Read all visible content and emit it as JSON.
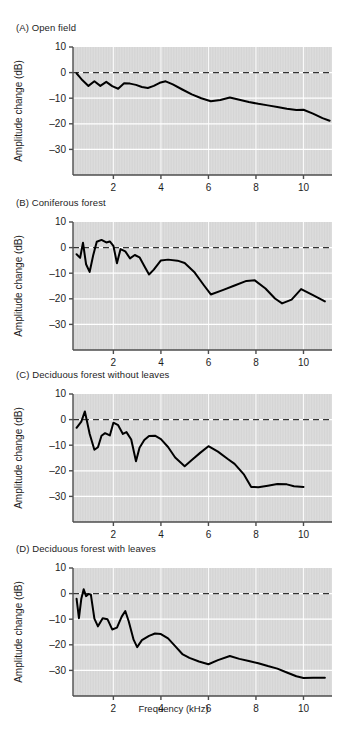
{
  "figure": {
    "background": "#ffffff",
    "plot_background": "#dcdcdc",
    "grid_color": "#ffffff",
    "axis_color": "#4d4d4d",
    "curve_color": "#000000",
    "reference_line_color": "#333333",
    "xlabel": "Frequency (kHz)"
  },
  "panels": [
    {
      "id": "A",
      "title": "(A)  Open field",
      "label_letter": "(A)",
      "label_text": "Open field"
    },
    {
      "id": "B",
      "title": "(B)  Coniferous forest",
      "label_letter": "(B)",
      "label_text": "Coniferous forest"
    },
    {
      "id": "C",
      "title": "(C)  Deciduous forest without leaves",
      "label_letter": "(C)",
      "label_text": "Deciduous forest without leaves"
    },
    {
      "id": "D",
      "title": "(D)  Deciduous forest with leaves",
      "label_letter": "(D)",
      "label_text": "Deciduous forest with leaves"
    }
  ],
  "chart_data": [
    {
      "type": "line",
      "panel": "A",
      "title": "(A)  Open field",
      "xlabel": "",
      "ylabel": "Amplitude change (dB)",
      "xlim": [
        0.3,
        11.2
      ],
      "ylim": [
        -40,
        10
      ],
      "xticks": [
        2,
        4,
        6,
        8,
        10
      ],
      "xtick_labels": [
        "2",
        "4",
        "6",
        "8",
        "10"
      ],
      "yticks": [
        10,
        0,
        -10,
        -20,
        -30
      ],
      "ytick_labels": [
        "10",
        "0",
        "-10",
        "-20",
        "-30"
      ],
      "grid": true,
      "legend": null,
      "annotations": [
        {
          "type": "hline",
          "y": 0,
          "style": "dashed",
          "label": "0 dB reference"
        }
      ],
      "series": [
        {
          "name": "Amplitude change",
          "x": [
            0.45,
            0.7,
            0.95,
            1.2,
            1.45,
            1.7,
            1.95,
            2.2,
            2.45,
            2.7,
            2.95,
            3.2,
            3.45,
            3.7,
            3.95,
            4.2,
            4.5,
            4.9,
            5.3,
            5.7,
            6.1,
            6.5,
            6.9,
            7.3,
            7.7,
            8.1,
            8.5,
            8.9,
            9.3,
            9.7,
            10.0,
            10.4,
            10.8,
            11.1
          ],
          "y": [
            -0.3,
            -3.0,
            -5.2,
            -3.4,
            -5.2,
            -3.6,
            -5.3,
            -6.3,
            -4.2,
            -4.3,
            -4.8,
            -5.6,
            -6.0,
            -5.2,
            -4.0,
            -3.4,
            -4.6,
            -6.6,
            -8.5,
            -10.0,
            -11.2,
            -10.7,
            -9.7,
            -10.6,
            -11.5,
            -12.2,
            -12.8,
            -13.4,
            -14.1,
            -14.6,
            -14.5,
            -16.0,
            -17.8,
            -18.8
          ]
        }
      ]
    },
    {
      "type": "line",
      "panel": "B",
      "title": "(B)  Coniferous forest",
      "xlabel": "",
      "ylabel": "Amplitude change (dB)",
      "xlim": [
        0.3,
        11.2
      ],
      "ylim": [
        -40,
        10
      ],
      "xticks": [
        2,
        4,
        6,
        8,
        10
      ],
      "xtick_labels": [
        "2",
        "4",
        "6",
        "8",
        "10"
      ],
      "yticks": [
        10,
        0,
        -10,
        -20,
        -30
      ],
      "ytick_labels": [
        "10",
        "0",
        "-10",
        "-20",
        "-30"
      ],
      "grid": true,
      "legend": null,
      "annotations": [
        {
          "type": "hline",
          "y": 0,
          "style": "dashed",
          "label": "0 dB reference"
        }
      ],
      "series": [
        {
          "name": "Amplitude change",
          "x": [
            0.45,
            0.6,
            0.72,
            0.85,
            1.0,
            1.15,
            1.3,
            1.5,
            1.7,
            1.85,
            2.0,
            2.15,
            2.3,
            2.5,
            2.7,
            2.9,
            3.1,
            3.3,
            3.5,
            3.7,
            4.0,
            4.3,
            4.7,
            5.0,
            5.4,
            5.8,
            6.1,
            6.6,
            7.1,
            7.6,
            7.95,
            8.4,
            8.8,
            9.1,
            9.5,
            9.9,
            10.4,
            10.9
          ],
          "y": [
            -2.6,
            -4.0,
            1.9,
            -6.5,
            -9.5,
            -3.0,
            2.3,
            3.0,
            2.0,
            2.4,
            0.7,
            -6.1,
            -0.6,
            -1.5,
            -4.2,
            -2.9,
            -3.8,
            -7.2,
            -10.5,
            -8.6,
            -5.0,
            -4.7,
            -5.1,
            -6.0,
            -9.5,
            -14.6,
            -18.3,
            -16.6,
            -14.8,
            -13.0,
            -12.8,
            -16.0,
            -19.9,
            -21.8,
            -20.3,
            -16.2,
            -18.6,
            -21.0
          ]
        }
      ]
    },
    {
      "type": "line",
      "panel": "C",
      "title": "(C)  Deciduous forest without leaves",
      "xlabel": "",
      "ylabel": "Amplitude change (dB)",
      "xlim": [
        0.3,
        11.2
      ],
      "ylim": [
        -40,
        10
      ],
      "xticks": [
        2,
        4,
        6,
        8,
        10
      ],
      "xtick_labels": [
        "2",
        "4",
        "6",
        "8",
        "10"
      ],
      "yticks": [
        10,
        0,
        -10,
        -20,
        -30
      ],
      "ytick_labels": [
        "10",
        "0",
        "-10",
        "-20",
        "-30"
      ],
      "grid": true,
      "legend": null,
      "annotations": [
        {
          "type": "hline",
          "y": 0,
          "style": "dashed",
          "label": "0 dB reference"
        }
      ],
      "series": [
        {
          "name": "Amplitude change",
          "x": [
            0.45,
            0.65,
            0.8,
            1.0,
            1.2,
            1.35,
            1.5,
            1.65,
            1.85,
            2.0,
            2.2,
            2.4,
            2.55,
            2.75,
            2.95,
            3.1,
            3.3,
            3.5,
            3.75,
            4.0,
            4.3,
            4.6,
            5.0,
            5.3,
            5.65,
            6.0,
            6.4,
            6.8,
            7.1,
            7.5,
            7.8,
            8.1,
            8.5,
            8.9,
            9.3,
            9.6,
            10.0
          ],
          "y": [
            -3.2,
            -0.8,
            3.2,
            -5.5,
            -11.8,
            -10.8,
            -6.3,
            -5.3,
            -6.2,
            -1.2,
            -2.2,
            -5.6,
            -4.9,
            -7.8,
            -16.3,
            -11.0,
            -8.0,
            -6.4,
            -6.3,
            -7.6,
            -10.7,
            -14.8,
            -18.2,
            -15.8,
            -13.0,
            -10.4,
            -12.5,
            -15.3,
            -17.3,
            -21.5,
            -26.3,
            -26.4,
            -25.8,
            -25.2,
            -25.3,
            -26.0,
            -26.3
          ]
        }
      ]
    },
    {
      "type": "line",
      "panel": "D",
      "title": "(D)  Deciduous forest with leaves",
      "xlabel": "Frequency (kHz)",
      "ylabel": "Amplitude change (dB)",
      "xlim": [
        0.3,
        11.2
      ],
      "ylim": [
        -40,
        10
      ],
      "xticks": [
        2,
        4,
        6,
        8,
        10
      ],
      "xtick_labels": [
        "2",
        "4",
        "6",
        "8",
        "10"
      ],
      "yticks": [
        10,
        0,
        -10,
        -20,
        -30
      ],
      "ytick_labels": [
        "10",
        "0",
        "-10",
        "-20",
        "-30"
      ],
      "grid": true,
      "legend": null,
      "annotations": [
        {
          "type": "hline",
          "y": 0,
          "style": "dashed",
          "label": "0 dB reference"
        }
      ],
      "series": [
        {
          "name": "Amplitude change",
          "x": [
            0.45,
            0.55,
            0.65,
            0.75,
            0.85,
            0.95,
            1.05,
            1.2,
            1.35,
            1.55,
            1.75,
            1.95,
            2.15,
            2.35,
            2.5,
            2.65,
            2.85,
            3.0,
            3.2,
            3.5,
            3.75,
            4.0,
            4.3,
            4.6,
            4.9,
            5.2,
            5.6,
            6.0,
            6.4,
            6.9,
            7.3,
            7.7,
            8.1,
            8.5,
            8.9,
            9.3,
            9.7,
            10.0,
            10.4,
            10.9
          ],
          "y": [
            -2.0,
            -9.6,
            -2.0,
            1.7,
            -1.0,
            -0.2,
            -0.3,
            -9.8,
            -12.8,
            -9.6,
            -10.0,
            -14.0,
            -13.3,
            -9.0,
            -6.8,
            -11.0,
            -18.0,
            -20.9,
            -18.2,
            -16.5,
            -15.6,
            -15.8,
            -17.5,
            -20.5,
            -23.6,
            -25.1,
            -26.5,
            -27.6,
            -26.0,
            -24.4,
            -25.5,
            -26.3,
            -27.2,
            -28.3,
            -29.3,
            -30.8,
            -32.3,
            -33.0,
            -32.9,
            -32.9
          ]
        }
      ]
    }
  ]
}
